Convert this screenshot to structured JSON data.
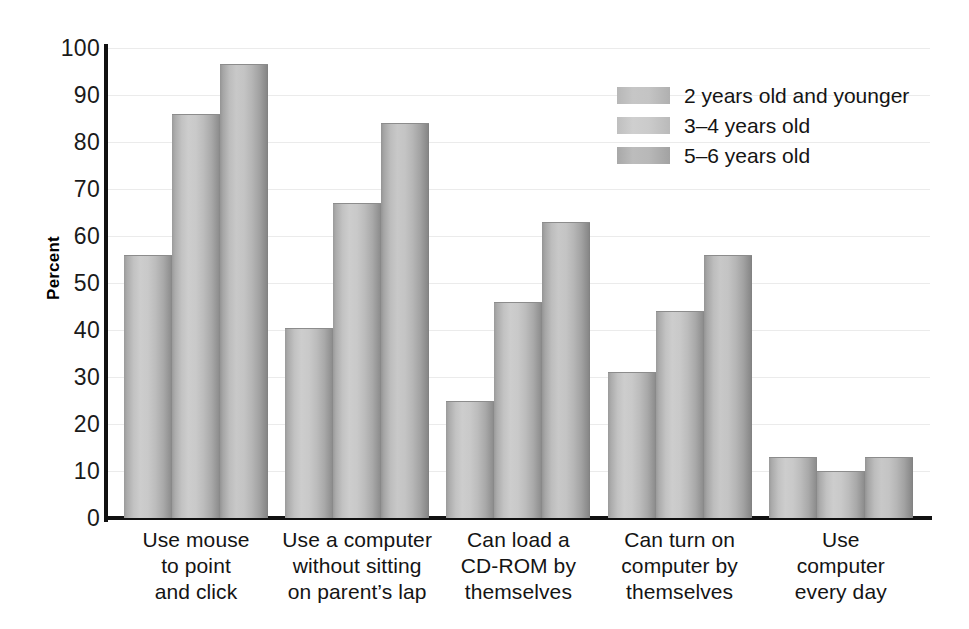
{
  "chart_data": {
    "type": "bar",
    "title": "",
    "subtitle": "",
    "xlabel": "",
    "ylabel": "Percent",
    "ylim": [
      0,
      100
    ],
    "ytick_step": 10,
    "grid": true,
    "legend_position": "top-right",
    "categories": [
      "Use mouse\nto point\nand click",
      "Use a computer\nwithout sitting\non parent's lap",
      "Can load a\nCD-ROM by\nthemselves",
      "Can turn on\ncomputer by\nthemselves",
      "Use\ncomputer\nevery day"
    ],
    "series": [
      {
        "name": "2 years old and younger",
        "values": [
          56,
          40.5,
          25,
          31,
          13
        ],
        "color": "#c4c4c4"
      },
      {
        "name": "3-4 years old",
        "values": [
          86,
          67,
          46,
          44,
          10
        ],
        "color": "#cbcbcb"
      },
      {
        "name": "5-6 years old",
        "values": [
          96.5,
          84,
          63,
          56,
          13
        ],
        "color": "#b8b8b8"
      }
    ]
  },
  "axes": {
    "y_title": "Percent",
    "y_ticks": [
      "100",
      "90",
      "80",
      "70",
      "60",
      "50",
      "40",
      "30",
      "20",
      "10",
      "0"
    ]
  },
  "categories": [
    {
      "lines": [
        "Use mouse",
        "to point",
        "and click"
      ]
    },
    {
      "lines": [
        "Use a computer",
        "without sitting",
        "on parent’s lap"
      ]
    },
    {
      "lines": [
        "Can load a",
        "CD-ROM by",
        "themselves"
      ]
    },
    {
      "lines": [
        "Can turn on",
        "computer by",
        "themselves"
      ]
    },
    {
      "lines": [
        "Use",
        "computer",
        "every day"
      ]
    }
  ],
  "legend": {
    "items": [
      {
        "label": "2 years old and younger",
        "swatch": "legend-swatch-series-1"
      },
      {
        "label": "3–4 years old",
        "swatch": "legend-swatch-series-2"
      },
      {
        "label": "5–6 years old",
        "swatch": "legend-swatch-series-3"
      }
    ]
  },
  "colors": {
    "background": "#ffffff",
    "axis": "#111111",
    "gridline": "#ebebeb",
    "text": "#141414",
    "bar_light": "#cdcdcd",
    "bar_dark": "#868686"
  }
}
